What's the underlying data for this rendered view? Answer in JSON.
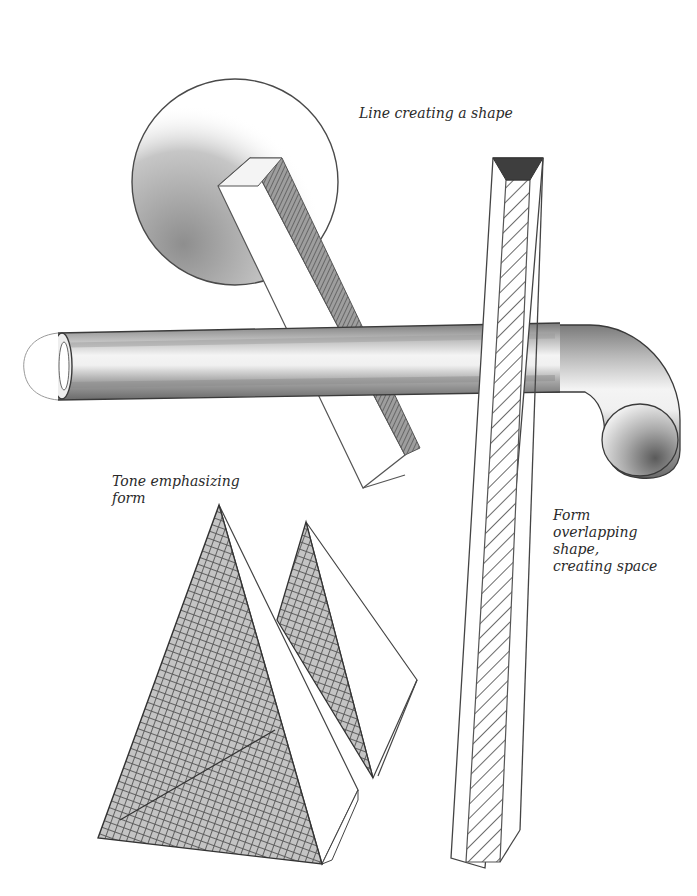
{
  "illustration": {
    "description": "Pencil drawing illustrating line, shape, form and tone",
    "background": "#ffffff",
    "ink_color": "#3a3a3a",
    "shade_dark": "#6e6e6e",
    "shade_mid": "#9a9a9a",
    "shade_light": "#cfcfcf"
  },
  "labels": {
    "line_shape": "Line creating a shape",
    "tone_form": "Tone emphasizing\nform",
    "form_overlap": "Form\noverlapping\nshape,\ncreating space"
  },
  "objects": [
    {
      "name": "shaded-circle",
      "kind": "circle",
      "note": "flat disc shaded diagonally on lower left"
    },
    {
      "name": "angled-beam",
      "kind": "rectangular prism",
      "note": "tilted beam crossing circle and pipe"
    },
    {
      "name": "bent-pipe",
      "kind": "cylinder",
      "note": "horizontal tube ending in downward elbow"
    },
    {
      "name": "vertical-beam",
      "kind": "rectangular prism",
      "note": "tall post with diagonal hatched face"
    },
    {
      "name": "large-pyramid",
      "kind": "pyramid",
      "note": "crosshatched face"
    },
    {
      "name": "small-pyramid",
      "kind": "pyramid",
      "note": "crosshatched face, behind large pyramid"
    }
  ]
}
